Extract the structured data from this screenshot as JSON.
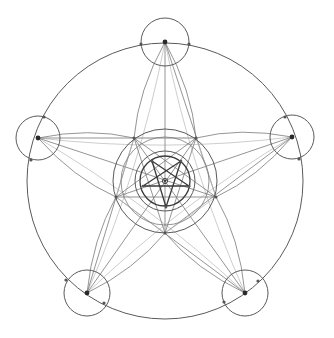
{
  "drawing": {
    "description": "Pencil geometric construction of a pentagram within concentric circles",
    "stroke_color": "#5a5a5a",
    "background": "#ffffff",
    "center": [
      165,
      181
    ],
    "outer_circle": {
      "cx": 165,
      "cy": 181,
      "r": 138
    },
    "concentric_circles": [
      {
        "r": 25,
        "style": "dark"
      },
      {
        "r": 30,
        "style": "med"
      },
      {
        "r": 44,
        "style": "thin"
      },
      {
        "r": 52,
        "style": "med"
      }
    ],
    "vertex_circles": [
      {
        "name": "top",
        "cx": 165,
        "cy": 42,
        "r": 24
      },
      {
        "name": "right",
        "cx": 292,
        "cy": 137,
        "r": 22
      },
      {
        "name": "bottom-right",
        "cx": 245,
        "cy": 293,
        "r": 23
      },
      {
        "name": "bottom-left",
        "cx": 87,
        "cy": 293,
        "r": 23
      },
      {
        "name": "left",
        "cx": 38,
        "cy": 138,
        "r": 22
      }
    ],
    "vertex_points": [
      [
        165,
        42
      ],
      [
        292,
        137
      ],
      [
        245,
        293
      ],
      [
        87,
        293
      ],
      [
        38,
        138
      ]
    ],
    "side_points": [
      [
        141,
        44
      ],
      [
        189,
        44
      ],
      [
        285,
        117
      ],
      [
        299,
        159
      ],
      [
        258,
        281
      ],
      [
        224,
        302
      ],
      [
        104,
        303
      ],
      [
        66,
        280
      ],
      [
        31,
        160
      ],
      [
        44,
        117
      ]
    ],
    "middle_pentagram": [
      [
        134,
        138
      ],
      [
        196,
        138
      ],
      [
        216,
        197
      ],
      [
        165,
        233
      ],
      [
        116,
        197
      ]
    ],
    "inner_pentagram": [
      [
        152,
        161
      ],
      [
        181,
        161
      ],
      [
        189,
        186
      ],
      [
        166,
        207
      ],
      [
        143,
        186
      ]
    ],
    "inner_pentagon_points": [
      [
        152,
        161
      ],
      [
        181,
        161
      ],
      [
        189,
        186
      ],
      [
        166,
        207
      ],
      [
        143,
        186
      ]
    ]
  }
}
